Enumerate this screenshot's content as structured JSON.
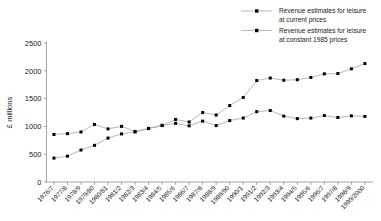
{
  "chart_data": {
    "type": "line",
    "title": "",
    "xlabel": "",
    "ylabel": "£ millions",
    "ylim": [
      0,
      2500
    ],
    "yticks": [
      0,
      500,
      1000,
      1500,
      2000,
      2500
    ],
    "grid": false,
    "legend_position": "top-right",
    "categories": [
      "1976/7",
      "1977/8",
      "1978/9",
      "1979/80",
      "1980/81",
      "1981/2",
      "1982/3",
      "1983/4",
      "1984/5",
      "1985/6",
      "1986/7",
      "1987/8",
      "1988/9",
      "1989/90",
      "1990/1",
      "1991/2",
      "1992/3",
      "1993/4",
      "1994/5",
      "1995/6",
      "1996/7",
      "1997/8",
      "1998/9",
      "1999/2000"
    ],
    "series": [
      {
        "name": "Revenue estimates for leisure at current prices",
        "values": [
          430,
          465,
          575,
          660,
          790,
          865,
          900,
          960,
          1015,
          1055,
          1010,
          1095,
          1015,
          1105,
          1150,
          1265,
          1285,
          1185,
          1140,
          1150,
          1195,
          1160,
          1190,
          1180
        ]
      },
      {
        "name": "Revenue estimates for leisure at constant 1985 prices",
        "values": [
          855,
          870,
          900,
          1035,
          955,
          1000,
          910,
          965,
          1020,
          1125,
          1080,
          1250,
          1205,
          1375,
          1520,
          1825,
          1870,
          1830,
          1840,
          1880,
          1945,
          1950,
          2035,
          2130
        ]
      }
    ]
  },
  "legend": {
    "entries": [
      {
        "line1": "Revenue estimates for leisure",
        "line2": "at current prices"
      },
      {
        "line1": "Revenue estimates for leisure",
        "line2": "at constant 1985 prices"
      }
    ]
  },
  "style": {
    "line_color": "#9a9a9a",
    "marker_color": "#000000",
    "axis_color": "#8c8c8c",
    "text_color": "#1a1a1a"
  }
}
